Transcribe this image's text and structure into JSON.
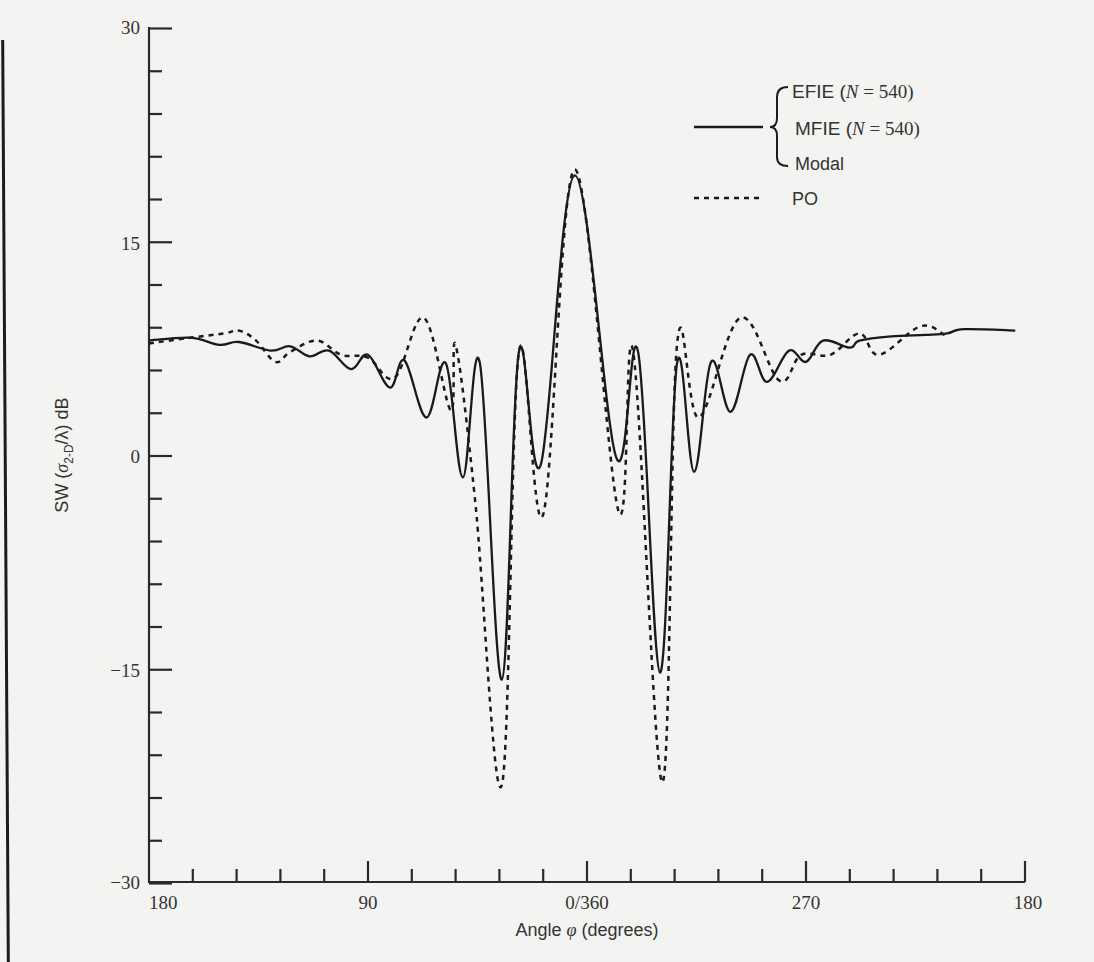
{
  "chart_data": {
    "type": "line",
    "title": "",
    "xlabel": "Angle φ (degrees)",
    "ylabel": "SW (σ_2-D/λ) dB",
    "ylim": [
      -30,
      30
    ],
    "y_ticks_labeled": [
      30,
      15,
      0,
      -15,
      -30
    ],
    "y_minor_step": 3,
    "x_tick_labels": [
      "180",
      "90",
      "0/360",
      "270",
      "180"
    ],
    "x_minor_step_deg": 18,
    "x_axis_note": "x positions given as axis position in degrees from left edge (0 = 180°, 90 = 90°, 180 = 0/360°, 270 = 270°, 360 = 180°)",
    "grid": false,
    "legend_position": "upper right",
    "legend": [
      {
        "style": "solid",
        "labels": [
          "EFIE (N = 540)",
          "MFIE (N = 540)",
          "Modal"
        ]
      },
      {
        "style": "dashed",
        "labels": [
          "PO"
        ]
      }
    ],
    "series": [
      {
        "name": "EFIE / MFIE (N = 540) / Modal",
        "style": "solid",
        "x": [
          0,
          17,
          29,
          37,
          50,
          58,
          66,
          74,
          83,
          90,
          99,
          105,
          114,
          122,
          129,
          136,
          145,
          152,
          161,
          175,
          192,
          201,
          210,
          217,
          224,
          231,
          239,
          247,
          254,
          263,
          270,
          277,
          288,
          292,
          305,
          319,
          328,
          335,
          356
        ],
        "values": [
          8.1,
          8.3,
          7.8,
          8.0,
          7.4,
          7.7,
          7.0,
          7.4,
          6.1,
          7.1,
          4.8,
          6.7,
          2.7,
          6.5,
          -1.5,
          6.5,
          -15.7,
          7.3,
          -0.6,
          19.7,
          -0.1,
          7.3,
          -15.2,
          6.5,
          -1.1,
          6.6,
          3.1,
          7.1,
          5.2,
          7.4,
          6.6,
          8.1,
          7.6,
          8.1,
          8.4,
          8.5,
          8.6,
          8.9,
          8.8
        ]
      },
      {
        "name": "PO",
        "style": "dashed",
        "x": [
          0,
          17,
          31,
          37,
          44,
          52,
          58,
          69,
          79,
          90,
          101,
          113,
          124,
          126,
          134,
          145,
          152,
          162,
          175,
          193,
          199,
          211,
          217,
          226,
          243,
          259,
          268,
          280,
          292,
          300,
          317,
          327
        ],
        "values": [
          7.9,
          8.3,
          8.6,
          8.8,
          8.1,
          6.6,
          7.3,
          8.1,
          7.1,
          6.9,
          5.5,
          9.7,
          3.2,
          7.8,
          -3.1,
          -23.1,
          7.3,
          -4.1,
          20.1,
          -3.9,
          7.3,
          -22.9,
          7.8,
          2.7,
          9.7,
          5.3,
          7.1,
          7.1,
          8.6,
          7.1,
          9.1,
          8.5
        ]
      }
    ]
  },
  "axes": {
    "y_labels": {
      "top": "30",
      "upper": "15",
      "mid": "0",
      "lower": "−15",
      "bottom": "−30"
    },
    "x_labels": {
      "left": "180",
      "q1": "90",
      "center": "0/360",
      "q3": "270",
      "right": "180"
    },
    "xlabel_prefix": "Angle ",
    "xlabel_symbol": "φ",
    "xlabel_suffix": " (degrees)",
    "ylabel_prefix": "SW (",
    "ylabel_sigma": "σ",
    "ylabel_sub": "2-D",
    "ylabel_suffix": "/λ) dB"
  },
  "legend": {
    "efie_prefix": "EFIE (",
    "mfie_prefix": "MFIE (",
    "n_symbol": "N",
    "n_value": " = 540)",
    "modal": "Modal",
    "po": "PO"
  }
}
